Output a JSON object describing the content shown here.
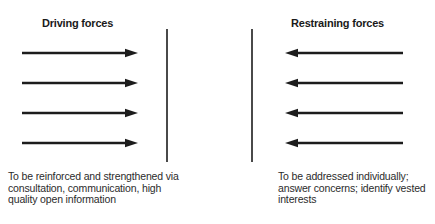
{
  "diagram": {
    "type": "force-field-analysis",
    "colors": {
      "background": "#ffffff",
      "arrow": "#1c1c1c",
      "divider": "#4a4a4a",
      "title_text": "#1a1a1a",
      "note_text": "#2b2b2b"
    },
    "left": {
      "title": "Driving forces",
      "arrow_direction": "right",
      "arrow_count": 4,
      "note": "To be reinforced and strengthened via\nconsultation, communication, high\nquality open information"
    },
    "right": {
      "title": "Restraining forces",
      "arrow_direction": "left",
      "arrow_count": 4,
      "note": "To be addressed individually;\nanswer concerns; identify vested\ninterests"
    }
  }
}
